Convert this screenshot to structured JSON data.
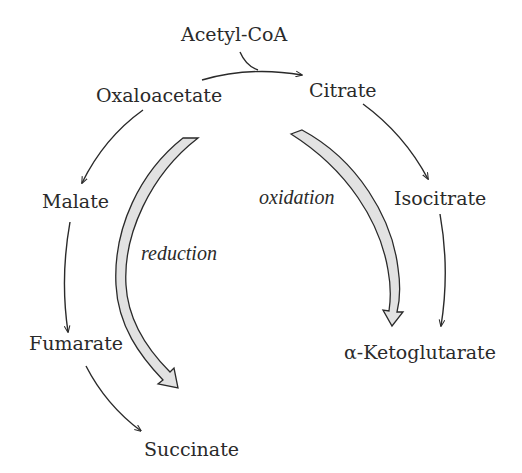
{
  "diagram": {
    "nodes": {
      "acetyl_coa": "Acetyl-CoA",
      "oxaloacetate": "Oxaloacetate",
      "citrate": "Citrate",
      "isocitrate": "Isocitrate",
      "alpha_ketoglutarate": "α-Ketoglutarate",
      "malate": "Malate",
      "fumarate": "Fumarate",
      "succinate": "Succinate"
    },
    "branch_labels": {
      "oxidation": "oxidation",
      "reduction": "reduction"
    },
    "edges": [
      {
        "from": "Oxaloacetate",
        "to": "Citrate",
        "with": "Acetyl-CoA"
      },
      {
        "from": "Citrate",
        "to": "Isocitrate"
      },
      {
        "from": "Isocitrate",
        "to": "α-Ketoglutarate"
      },
      {
        "from": "Oxaloacetate",
        "to": "Malate"
      },
      {
        "from": "Malate",
        "to": "Fumarate"
      },
      {
        "from": "Fumarate",
        "to": "Succinate"
      }
    ],
    "colors": {
      "ink": "#2a2a2a",
      "branch_arrow_fill": "#e2e2e2",
      "background": "#ffffff"
    }
  }
}
